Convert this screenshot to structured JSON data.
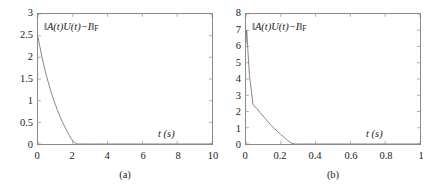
{
  "figure": {
    "background": "#ffffff",
    "axis_color": "#8a8a8a",
    "curve_color": "#6e6e6e"
  },
  "panels": [
    {
      "key": "a",
      "caption": "(a)",
      "annotation_text": "‖A(t)U(t)−I‖F",
      "annotation_parts": {
        "open_bars": "‖",
        "a_of_t": "A(t)U(t)−I",
        "close_bars": "‖",
        "subscript": "F"
      },
      "xlabel": "t (s)",
      "xticklabels": [
        "0",
        "2",
        "4",
        "6",
        "8",
        "10"
      ],
      "yticklabels": [
        "0",
        "0.5",
        "1",
        "1.5",
        "2",
        "2.5",
        "3"
      ]
    },
    {
      "key": "b",
      "caption": "(b)",
      "annotation_text": "‖A(t)U(t)−I‖F",
      "annotation_parts": {
        "open_bars": "‖",
        "a_of_t": "A(t)U(t)−I",
        "close_bars": "‖",
        "subscript": "F"
      },
      "xlabel": "t (s)",
      "xticklabels": [
        "0",
        "0.2",
        "0.4",
        "0.6",
        "0.8",
        "1"
      ],
      "yticklabels": [
        "0",
        "1",
        "2",
        "3",
        "4",
        "5",
        "6",
        "7",
        "8"
      ]
    }
  ],
  "chart_data": [
    {
      "type": "line",
      "title": "",
      "subplot_label": "(a)",
      "annotation": "‖A(t)U(t)−I‖F",
      "xlabel": "t (s)",
      "ylabel": "",
      "xlim": [
        0,
        10
      ],
      "ylim": [
        0,
        3
      ],
      "xticks": [
        0,
        2,
        4,
        6,
        8,
        10
      ],
      "yticks": [
        0,
        0.5,
        1,
        1.5,
        2,
        2.5,
        3
      ],
      "grid": false,
      "legend": "none",
      "series": [
        {
          "name": "‖A(t)U(t)−I‖F",
          "x": [
            0,
            0.05,
            0.1,
            0.2,
            0.3,
            0.4,
            0.5,
            0.6,
            0.7,
            0.8,
            0.9,
            1.0,
            1.1,
            1.2,
            1.3,
            1.4,
            1.5,
            1.6,
            1.7,
            1.8,
            1.9,
            2.0,
            2.1,
            2.2,
            2.3,
            2.4,
            3.0,
            4.0,
            6.0,
            8.0,
            10.0
          ],
          "y": [
            2.47,
            2.36,
            2.26,
            2.06,
            1.88,
            1.71,
            1.55,
            1.41,
            1.27,
            1.14,
            1.02,
            0.91,
            0.8,
            0.7,
            0.6,
            0.51,
            0.43,
            0.35,
            0.27,
            0.2,
            0.13,
            0.07,
            0.03,
            0.01,
            0.0,
            0.0,
            0.0,
            0.0,
            0.0,
            0.0,
            0.0
          ]
        }
      ]
    },
    {
      "type": "line",
      "title": "",
      "subplot_label": "(b)",
      "annotation": "‖A(t)U(t)−I‖F",
      "xlabel": "t (s)",
      "ylabel": "",
      "xlim": [
        0,
        1
      ],
      "ylim": [
        0,
        8
      ],
      "xticks": [
        0,
        0.2,
        0.4,
        0.6,
        0.8,
        1
      ],
      "yticks": [
        0,
        1,
        2,
        3,
        4,
        5,
        6,
        7,
        8
      ],
      "grid": false,
      "legend": "none",
      "series": [
        {
          "name": "‖A(t)U(t)−I‖F",
          "x": [
            0,
            0.004,
            0.01,
            0.02,
            0.04,
            0.06,
            0.08,
            0.1,
            0.12,
            0.14,
            0.16,
            0.18,
            0.2,
            0.22,
            0.24,
            0.26,
            0.28,
            0.3,
            0.4,
            0.6,
            0.8,
            1.0
          ],
          "y": [
            6.2,
            7.0,
            5.9,
            4.2,
            2.45,
            2.2,
            1.95,
            1.7,
            1.45,
            1.2,
            0.98,
            0.78,
            0.58,
            0.4,
            0.22,
            0.06,
            0.0,
            0.0,
            0.0,
            0.0,
            0.0,
            0.0
          ]
        }
      ]
    }
  ]
}
